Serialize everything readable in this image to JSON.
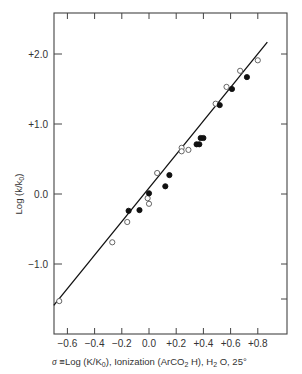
{
  "chart_data": {
    "type": "scatter",
    "title": "",
    "xlabel": "σ ≡ Log (K/K0), Ionization (ArCO2H), H2O, 25°",
    "ylabel": "Log (k/k0)",
    "xlim": [
      -0.7,
      1.0
    ],
    "ylim": [
      -2.0,
      2.6
    ],
    "x_ticks": [
      -0.6,
      -0.4,
      -0.2,
      0.0,
      0.2,
      0.4,
      0.6,
      0.8
    ],
    "x_tick_labels": [
      "−0.6",
      "−0.4",
      "−0.2",
      "0.0",
      "+0.2",
      "+0.4",
      "+0.6",
      "+0.8"
    ],
    "y_ticks": [
      2.0,
      1.0,
      0.0,
      -1.0
    ],
    "y_tick_labels": [
      "+2.0",
      "+1.0",
      "0.0",
      "−1.0"
    ],
    "grid": false,
    "legend": null,
    "series": [
      {
        "name": "open circles",
        "marker": "open-circle",
        "points": [
          [
            -0.66,
            -1.53
          ],
          [
            -0.27,
            -0.69
          ],
          [
            -0.16,
            -0.4
          ],
          [
            -0.01,
            -0.06
          ],
          [
            0.0,
            -0.14
          ],
          [
            0.06,
            0.3
          ],
          [
            0.24,
            0.66
          ],
          [
            0.24,
            0.61
          ],
          [
            0.29,
            0.63
          ],
          [
            0.49,
            1.29
          ],
          [
            0.57,
            1.53
          ],
          [
            0.67,
            1.76
          ],
          [
            0.8,
            1.91
          ]
        ]
      },
      {
        "name": "filled circles",
        "marker": "filled-circle",
        "points": [
          [
            -0.15,
            -0.24
          ],
          [
            -0.07,
            -0.23
          ],
          [
            0.0,
            0.01
          ],
          [
            0.12,
            0.11
          ],
          [
            0.15,
            0.27
          ],
          [
            0.35,
            0.71
          ],
          [
            0.37,
            0.71
          ],
          [
            0.38,
            0.8
          ],
          [
            0.4,
            0.8
          ],
          [
            0.52,
            1.27
          ],
          [
            0.61,
            1.5
          ],
          [
            0.72,
            1.67
          ]
        ]
      }
    ],
    "fit_line": {
      "x": [
        -0.7,
        0.87
      ],
      "y": [
        -1.59,
        2.17
      ]
    }
  },
  "labels": {
    "ylabel": "Log (k/k",
    "ylabel_sub": "0",
    "ylabel_end": ")",
    "xlabel_sigma": "σ",
    "xlabel_equiv": "≡",
    "xlabel_part1": "Log (K/K",
    "xlabel_sub1": "0",
    "xlabel_part2": "), Ionization (ArCO",
    "xlabel_sub2": "2",
    "xlabel_part3": " H), H",
    "xlabel_sub3": "2",
    "xlabel_part4": " O, 25°"
  }
}
